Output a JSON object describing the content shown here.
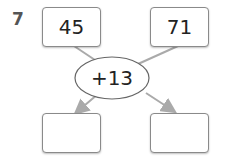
{
  "problem": {
    "number": "7",
    "inputs": [
      "45",
      "71"
    ],
    "operation": "+13",
    "outputs": [
      "",
      ""
    ]
  },
  "colors": {
    "line": "#aaaaaa",
    "border": "#8a8a8a"
  }
}
